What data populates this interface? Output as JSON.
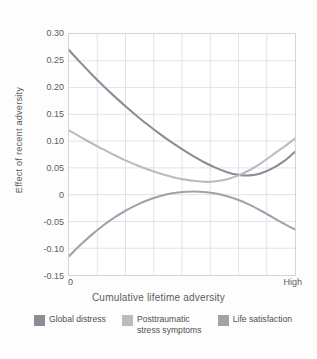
{
  "chart_data": {
    "type": "line",
    "title": "",
    "xlabel": "Cumulative lifetime adversity",
    "ylabel": "Effect of recent adversity",
    "xlim": [
      0,
      1
    ],
    "ylim": [
      -0.15,
      0.3
    ],
    "grid": true,
    "x_tick_labels": [
      "0",
      "High"
    ],
    "y_tick_labels": [
      "0.30",
      "0.25",
      "0.20",
      "0.15",
      "0.10",
      "0.05",
      "0",
      "-0.05",
      "-0.10",
      "-0.15"
    ],
    "y_ticks": [
      0.3,
      0.25,
      0.2,
      0.15,
      0.1,
      0.05,
      0,
      -0.05,
      -0.1,
      -0.15
    ],
    "x_gridlines": 8,
    "legend_position": "bottom",
    "series": [
      {
        "name": "Global distress",
        "color": "#8a8d93",
        "x": [
          0.0,
          0.05,
          0.1,
          0.15,
          0.2,
          0.25,
          0.3,
          0.35,
          0.4,
          0.45,
          0.5,
          0.55,
          0.6,
          0.65,
          0.7,
          0.75,
          0.8,
          0.85,
          0.9,
          0.95,
          1.0
        ],
        "values": [
          0.27,
          0.247,
          0.225,
          0.204,
          0.184,
          0.165,
          0.147,
          0.13,
          0.114,
          0.099,
          0.085,
          0.072,
          0.06,
          0.05,
          0.042,
          0.037,
          0.036,
          0.04,
          0.049,
          0.062,
          0.08
        ]
      },
      {
        "name": "Posttraumatic\nstress symptoms",
        "color": "#b9bcc2",
        "x": [
          0.0,
          0.05,
          0.1,
          0.15,
          0.2,
          0.25,
          0.3,
          0.35,
          0.4,
          0.45,
          0.5,
          0.55,
          0.6,
          0.65,
          0.7,
          0.75,
          0.8,
          0.85,
          0.9,
          0.95,
          1.0
        ],
        "values": [
          0.12,
          0.108,
          0.096,
          0.085,
          0.074,
          0.064,
          0.055,
          0.047,
          0.04,
          0.034,
          0.029,
          0.026,
          0.024,
          0.025,
          0.029,
          0.036,
          0.046,
          0.059,
          0.074,
          0.089,
          0.105
        ]
      },
      {
        "name": "Life satisfaction",
        "color": "#a0a3a9",
        "x": [
          0.0,
          0.05,
          0.1,
          0.15,
          0.2,
          0.25,
          0.3,
          0.35,
          0.4,
          0.45,
          0.5,
          0.55,
          0.6,
          0.65,
          0.7,
          0.75,
          0.8,
          0.85,
          0.9,
          0.95,
          1.0
        ],
        "values": [
          -0.115,
          -0.094,
          -0.075,
          -0.058,
          -0.043,
          -0.03,
          -0.019,
          -0.01,
          -0.003,
          0.002,
          0.005,
          0.006,
          0.005,
          0.002,
          -0.003,
          -0.01,
          -0.019,
          -0.03,
          -0.042,
          -0.054,
          -0.065
        ]
      }
    ]
  },
  "legend": {
    "items": [
      {
        "label": "Global distress",
        "color": "#8a8d93"
      },
      {
        "label": "Posttraumatic\nstress symptoms",
        "color": "#b9bcc2"
      },
      {
        "label": "Life satisfaction",
        "color": "#a0a3a9"
      }
    ]
  },
  "style": {
    "grid_color": "#dfe3ea",
    "axis_border_color": "#cfd4dd",
    "text_color": "#5c5c5c",
    "background": "#fdfdfd",
    "plot_background": "#ffffff"
  }
}
